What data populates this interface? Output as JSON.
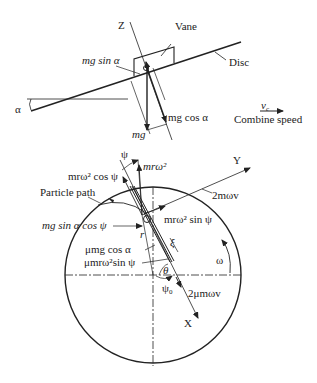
{
  "top_view": {
    "labels": {
      "z_axis": "Z",
      "vane": "Vane",
      "disc": "Disc",
      "alpha": "α",
      "mg_sin_alpha": "mg sin α",
      "mg_cos_alpha": "mg cos α",
      "mg": "mg",
      "vc": "v",
      "vc_sub": "c",
      "combine_speed": "Combine speed"
    }
  },
  "bottom_view": {
    "labels": {
      "psi": "ψ",
      "mr_omega2": "mrω²",
      "mr_omega2_cos_psi": "mrω² cos ψ",
      "particle_path": "Particle path",
      "mg_sin_alpha_cos_psi": "mg  sin α  cos ψ",
      "mr_omega2_sin_psi": "mrω²  sin ψ",
      "y_axis": "Y",
      "two_m_omega_v": "2mωv",
      "r": "r",
      "xi": "ξ",
      "mu_mg_cos_alpha": "μmg  cos α",
      "mu_mr_omega2_sin_psi": "μmrω²sin ψ",
      "omega": "ω",
      "theta": "θ",
      "psi0": "ψ",
      "psi0_sub": "0",
      "two_mu_m_omega_v": "2μmωv",
      "x_axis": "X"
    }
  }
}
